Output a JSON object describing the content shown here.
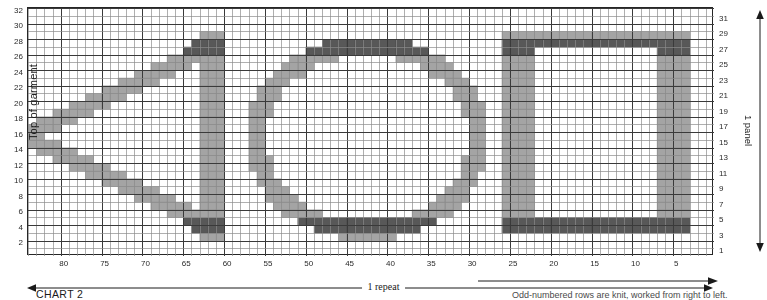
{
  "chart_title": "CHART 2",
  "labels": {
    "left_axis": "Top of garment",
    "right_axis": "1 panel",
    "repeat": "1 repeat",
    "footnote": "Odd-numbered rows are knit, worked from right to left."
  },
  "colors": {
    "grid_minor": "#8d8d8d",
    "grid_major": "#3a3a3a",
    "border": "#262626",
    "cell_fill": "#8a8a8a",
    "cell_fill_dark": "#4a4a4a",
    "background": "#ffffff",
    "text": "#1a1a1a"
  },
  "icons": {
    "left_arrow": "left-arrow-icon",
    "right_arrow": "right-arrow-icon",
    "up_down_arrow": "up-down-arrow-icon"
  },
  "chart_data": {
    "type": "heatmap",
    "title": "CHART 2",
    "xlabel": "1 repeat",
    "ylabel": "Top of garment",
    "grid": true,
    "legend": null,
    "x_axis": {
      "direction": "right-to-left",
      "min": 1,
      "max": 84,
      "tick_step": 5,
      "tick_labels": [
        80,
        75,
        70,
        65,
        60,
        55,
        50,
        45,
        40,
        35,
        30,
        25,
        20,
        15,
        10,
        5
      ]
    },
    "y_axis_left": {
      "direction": "bottom-to-top",
      "min": 1,
      "max": 32,
      "tick_step": 2,
      "tick_labels": [
        2,
        4,
        6,
        8,
        10,
        12,
        14,
        16,
        18,
        20,
        22,
        24,
        26,
        28,
        30,
        32
      ]
    },
    "y_axis_right": {
      "direction": "bottom-to-top",
      "min": 1,
      "max": 32,
      "tick_step": 2,
      "tick_labels": [
        1,
        3,
        5,
        7,
        9,
        11,
        13,
        15,
        17,
        19,
        21,
        23,
        25,
        27,
        29,
        31
      ]
    },
    "n_columns": 84,
    "n_rows": 32,
    "motifs": [
      {
        "name": "leaf-triangle",
        "description": "Pointed leaf / wedge outline opening toward the left, closed by a solid vertical bar at column 60-61.",
        "col_range": [
          60,
          84
        ],
        "row_range": [
          4,
          28
        ]
      },
      {
        "name": "oval-ring",
        "description": "Large oval / circular outline ring centred near column 44, rows 4-28.",
        "col_range": [
          29,
          57
        ],
        "row_range": [
          4,
          28
        ]
      },
      {
        "name": "open-rectangle",
        "description": "Open-sided rectangle outline, solid top and bottom bars and two solid side bars.",
        "col_range": [
          3,
          26
        ],
        "row_range": [
          4,
          29
        ]
      }
    ],
    "filled_cells_runs": [
      {
        "row": 28,
        "cols": [
          [
            61,
            63
          ],
          [
            22,
            26
          ],
          [
            4,
            6
          ],
          [
            42,
            47
          ]
        ]
      },
      {
        "row": 27,
        "cols": [
          [
            61,
            63
          ],
          [
            22,
            26
          ],
          [
            4,
            6
          ],
          [
            42,
            47
          ],
          [
            67,
            71
          ],
          [
            39,
            41
          ],
          [
            48,
            50
          ]
        ]
      },
      {
        "row": 26,
        "cols": [
          [
            61,
            63
          ],
          [
            22,
            26
          ],
          [
            4,
            6
          ],
          [
            67,
            71
          ],
          [
            37,
            38
          ],
          [
            51,
            52
          ]
        ]
      },
      {
        "row": 25,
        "cols": [
          [
            61,
            63
          ],
          [
            22,
            26
          ],
          [
            4,
            6
          ],
          [
            72,
            74
          ],
          [
            36,
            37
          ],
          [
            52,
            53
          ]
        ]
      },
      {
        "row": 16,
        "cols": [
          [
            61,
            63
          ],
          [
            22,
            26
          ],
          [
            4,
            6
          ],
          [
            82,
            84
          ],
          [
            30,
            31
          ],
          [
            57,
            58
          ]
        ]
      },
      {
        "row": 5,
        "cols": [
          [
            61,
            63
          ],
          [
            4,
            26
          ],
          [
            42,
            47
          ]
        ]
      },
      {
        "row": 4,
        "cols": [
          [
            61,
            63
          ],
          [
            4,
            26
          ],
          [
            42,
            47
          ]
        ]
      }
    ]
  },
  "axis_ticks": {
    "left": [
      "32",
      "30",
      "28",
      "26",
      "24",
      "22",
      "20",
      "18",
      "16",
      "14",
      "12",
      "10",
      "8",
      "6",
      "4",
      "2"
    ],
    "right": [
      "31",
      "29",
      "27",
      "25",
      "23",
      "21",
      "19",
      "17",
      "15",
      "13",
      "11",
      "9",
      "7",
      "5",
      "3",
      "1"
    ],
    "bottom": [
      "80",
      "75",
      "70",
      "65",
      "60",
      "55",
      "50",
      "45",
      "40",
      "35",
      "30",
      "25",
      "20",
      "15",
      "10",
      "5"
    ]
  }
}
